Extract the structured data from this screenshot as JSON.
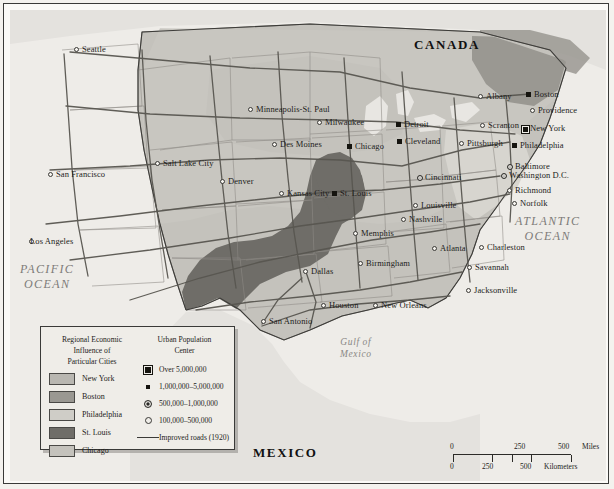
{
  "map": {
    "countries": [
      {
        "name": "CANADA",
        "x": 404,
        "y": 34
      },
      {
        "name": "MEXICO",
        "x": 243,
        "y": 442
      }
    ],
    "oceans": [
      {
        "name": "PACIFIC\nOCEAN",
        "line1": "PACIFIC",
        "line2": "OCEAN",
        "x": 12,
        "y": 258
      },
      {
        "name": "ATLANTIC\nOCEAN",
        "line1": "ATLANTIC",
        "line2": "OCEAN",
        "x": 513,
        "y": 211
      }
    ],
    "seas": [
      {
        "line1": "Gulf of",
        "line2": "Mexico",
        "x": 337,
        "y": 333
      }
    ],
    "cities": [
      {
        "name": "Seattle",
        "x": 67,
        "y": 40,
        "size": 4,
        "anchor": "right"
      },
      {
        "name": "San Francisco",
        "x": 41,
        "y": 165,
        "size": 4,
        "anchor": "right"
      },
      {
        "name": "Los Angeles",
        "x": 22,
        "y": 232,
        "size": 4,
        "anchor": "left"
      },
      {
        "name": "Salt Lake City",
        "x": 148,
        "y": 154,
        "size": 4,
        "anchor": "right"
      },
      {
        "name": "Denver",
        "x": 213,
        "y": 172,
        "size": 4,
        "anchor": "right"
      },
      {
        "name": "Minneapolis-St. Paul",
        "x": 241,
        "y": 100,
        "size": 4,
        "anchor": "right"
      },
      {
        "name": "Des Moines",
        "x": 265,
        "y": 135,
        "size": 4,
        "anchor": "right"
      },
      {
        "name": "Milwaukee",
        "x": 310,
        "y": 113,
        "size": 4,
        "anchor": "right"
      },
      {
        "name": "Chicago",
        "x": 340,
        "y": 137,
        "size": 2,
        "anchor": "right"
      },
      {
        "name": "Detroit",
        "x": 389,
        "y": 115,
        "size": 2,
        "anchor": "right"
      },
      {
        "name": "Cleveland",
        "x": 390,
        "y": 132,
        "size": 2,
        "anchor": "right"
      },
      {
        "name": "Cincinnati",
        "x": 410,
        "y": 168,
        "size": 3,
        "anchor": "right"
      },
      {
        "name": "Louisville",
        "x": 406,
        "y": 196,
        "size": 4,
        "anchor": "right"
      },
      {
        "name": "Nashville",
        "x": 394,
        "y": 210,
        "size": 4,
        "anchor": "right"
      },
      {
        "name": "Kansas City",
        "x": 272,
        "y": 184,
        "size": 4,
        "anchor": "right"
      },
      {
        "name": "St. Louis",
        "x": 325,
        "y": 184,
        "size": 2,
        "anchor": "right"
      },
      {
        "name": "Memphis",
        "x": 346,
        "y": 224,
        "size": 4,
        "anchor": "right"
      },
      {
        "name": "Birmingham",
        "x": 351,
        "y": 254,
        "size": 4,
        "anchor": "right"
      },
      {
        "name": "Atlanta",
        "x": 425,
        "y": 239,
        "size": 4,
        "anchor": "right"
      },
      {
        "name": "Charleston",
        "x": 472,
        "y": 238,
        "size": 4,
        "anchor": "right"
      },
      {
        "name": "Savannah",
        "x": 460,
        "y": 258,
        "size": 4,
        "anchor": "right"
      },
      {
        "name": "Jacksonville",
        "x": 459,
        "y": 281,
        "size": 4,
        "anchor": "right"
      },
      {
        "name": "New Orleans",
        "x": 366,
        "y": 296,
        "size": 4,
        "anchor": "right"
      },
      {
        "name": "Houston",
        "x": 314,
        "y": 296,
        "size": 4,
        "anchor": "right"
      },
      {
        "name": "San Antonio",
        "x": 254,
        "y": 312,
        "size": 4,
        "anchor": "right"
      },
      {
        "name": "Dallas",
        "x": 296,
        "y": 262,
        "size": 4,
        "anchor": "right"
      },
      {
        "name": "Albany",
        "x": 471,
        "y": 87,
        "size": 4,
        "anchor": "right"
      },
      {
        "name": "Boston",
        "x": 519,
        "y": 85,
        "size": 2,
        "anchor": "right"
      },
      {
        "name": "Providence",
        "x": 523,
        "y": 101,
        "size": 4,
        "anchor": "right"
      },
      {
        "name": "New York",
        "x": 515,
        "y": 119,
        "size": 1,
        "anchor": "right"
      },
      {
        "name": "Scranton",
        "x": 473,
        "y": 116,
        "size": 4,
        "anchor": "right"
      },
      {
        "name": "Pittsburgh",
        "x": 452,
        "y": 134,
        "size": 4,
        "anchor": "right"
      },
      {
        "name": "Philadelphia",
        "x": 505,
        "y": 136,
        "size": 2,
        "anchor": "right"
      },
      {
        "name": "Baltimore",
        "x": 500,
        "y": 157,
        "size": 3,
        "anchor": "right"
      },
      {
        "name": "Washington D.C.",
        "x": 494,
        "y": 166,
        "size": 3,
        "anchor": "right"
      },
      {
        "name": "Richmond",
        "x": 500,
        "y": 181,
        "size": 4,
        "anchor": "right"
      },
      {
        "name": "Norfolk",
        "x": 505,
        "y": 194,
        "size": 4,
        "anchor": "right"
      }
    ]
  },
  "legend": {
    "title_lines": [
      "Regional Economic",
      "Influence of",
      "Particular Cities"
    ],
    "influence": [
      {
        "label": "New York",
        "color": "#b9b7b1"
      },
      {
        "label": "Boston",
        "color": "#9a9892"
      },
      {
        "label": "Philadelphia",
        "color": "#cfcdc7"
      },
      {
        "label": "St. Louis",
        "color": "#6f6d68"
      },
      {
        "label": "Chicago",
        "color": "#c4c2bc"
      }
    ],
    "population": {
      "title_lines": [
        "Urban Population",
        "Center"
      ],
      "classes": [
        {
          "label": "Over 5,000,000",
          "symbol": "square-ringed-icon"
        },
        {
          "label": "1,000,000–5,000,000",
          "symbol": "square-small-icon"
        },
        {
          "label": "500,000–1,000,000",
          "symbol": "circle-dot-icon"
        },
        {
          "label": "100,000–500,000",
          "symbol": "circle-open-icon"
        }
      ],
      "roads_label": "Improved roads (1920)"
    }
  },
  "scale": {
    "miles": {
      "ticks": [
        "0",
        "250",
        "500"
      ],
      "unit": "Miles"
    },
    "kilometers": {
      "ticks": [
        "0",
        "250",
        "500"
      ],
      "unit": "Kilometers"
    }
  }
}
